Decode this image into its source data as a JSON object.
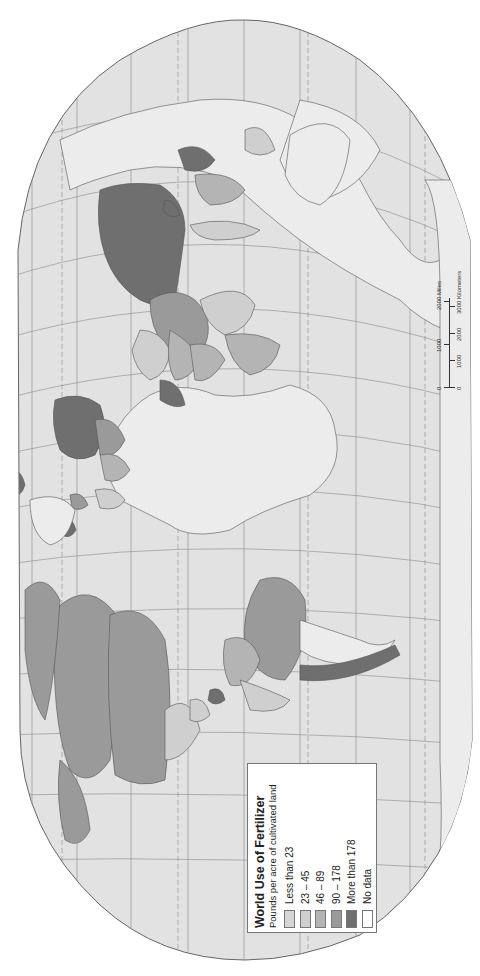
{
  "map": {
    "orientation": "rotated 90 degrees clockwise (north to the right)",
    "colors": {
      "ocean": "#e2e2e2",
      "unclassified_land": "#ececec",
      "less_than_23": "#d6d6d6",
      "23_45": "#cfcfcf",
      "46_89": "#b4b4b4",
      "90_178": "#9a9a9a",
      "more_than_178": "#6f6f6f",
      "no_data": "#ffffff",
      "grid": "#8a8a8a",
      "border": "#555555"
    }
  },
  "legend": {
    "title": "World Use of Fertilizer",
    "subtitle": "Pounds per acre of cultivated land",
    "items": [
      {
        "label": "Less than 23",
        "color": "#d6d6d6"
      },
      {
        "label": "23 – 45",
        "color": "#cfcfcf"
      },
      {
        "label": "46 – 89",
        "color": "#b4b4b4"
      },
      {
        "label": "90 – 178",
        "color": "#9a9a9a"
      },
      {
        "label": "More than 178",
        "color": "#6f6f6f"
      },
      {
        "label": "No data",
        "color": "#ffffff"
      }
    ]
  },
  "scale": {
    "miles_labels": [
      "0",
      "1000",
      "2000 Miles"
    ],
    "km_labels": [
      "0",
      "1000",
      "2000",
      "3000 Kilometers"
    ]
  }
}
